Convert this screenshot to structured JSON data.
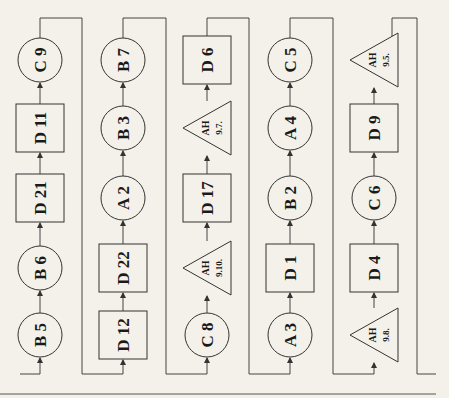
{
  "diagram": {
    "orientation": "rotated-90-ccw",
    "flow": "bottom-to-top within each column, columns chained left to right via top/bottom connectors",
    "columns": [
      {
        "nodes": [
          {
            "shape": "circle",
            "label": "B 5"
          },
          {
            "shape": "circle",
            "label": "B 6"
          },
          {
            "shape": "rect",
            "label": "D 21"
          },
          {
            "shape": "rect",
            "label": "D 11"
          },
          {
            "shape": "circle",
            "label": "C 9"
          }
        ]
      },
      {
        "nodes": [
          {
            "shape": "rect",
            "label": "D 12"
          },
          {
            "shape": "rect",
            "label": "D 22"
          },
          {
            "shape": "circle",
            "label": "A 2"
          },
          {
            "shape": "circle",
            "label": "B 3"
          },
          {
            "shape": "circle",
            "label": "B 7"
          }
        ]
      },
      {
        "nodes": [
          {
            "shape": "circle",
            "label": "C 8"
          },
          {
            "shape": "triangle",
            "label": "AH",
            "sub": "9.10."
          },
          {
            "shape": "rect",
            "label": "D 17"
          },
          {
            "shape": "triangle",
            "label": "AH",
            "sub": "9.7."
          },
          {
            "shape": "rect",
            "label": "D 6"
          }
        ]
      },
      {
        "nodes": [
          {
            "shape": "circle",
            "label": "A 3"
          },
          {
            "shape": "rect",
            "label": "D 1"
          },
          {
            "shape": "circle",
            "label": "B 2"
          },
          {
            "shape": "circle",
            "label": "A 4"
          },
          {
            "shape": "circle",
            "label": "C 5"
          }
        ]
      },
      {
        "nodes": [
          {
            "shape": "triangle",
            "label": "AH",
            "sub": "9.8."
          },
          {
            "shape": "rect",
            "label": "D 4"
          },
          {
            "shape": "circle",
            "label": "C 6"
          },
          {
            "shape": "rect",
            "label": "D 9"
          },
          {
            "shape": "triangle",
            "label": "AH",
            "sub": "9.5."
          }
        ]
      }
    ]
  }
}
